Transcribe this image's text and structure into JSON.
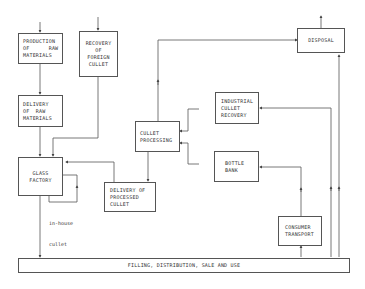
{
  "diagram": {
    "type": "flowchart",
    "nodes": {
      "production_raw": {
        "lines": [
          "PRODUCTION",
          "OF      RAW",
          "MATERIALS"
        ]
      },
      "recovery_foreign": {
        "lines": [
          "RECOVERY",
          "OF",
          "FOREIGN",
          "CULLET"
        ]
      },
      "delivery_raw": {
        "lines": [
          "DELIVERY",
          "OF  RAW",
          "MATERIALS"
        ]
      },
      "glass_factory": {
        "lines": [
          "GLASS",
          "",
          "FACTORY"
        ]
      },
      "delivery_processed": {
        "lines": [
          "DELIVERY OF",
          "PROCESSED",
          "CULLET"
        ]
      },
      "cullet_processing": {
        "lines": [
          "CULLET",
          "",
          "PROCESSING"
        ]
      },
      "industrial_recovery": {
        "lines": [
          "INDUSTRIAL",
          "CULLET",
          "RECOVERY"
        ]
      },
      "bottle_bank": {
        "lines": [
          "BOTTLE",
          "",
          "BANK"
        ]
      },
      "disposal": {
        "lines": [
          "DISPOSAL"
        ]
      },
      "consumer_transport": {
        "lines": [
          "CONSUMER",
          "TRANSPORT"
        ]
      },
      "filling": {
        "lines": [
          "FILLING, DISTRIBUTION, SALE AND USE"
        ]
      }
    },
    "annotations": {
      "in_house": {
        "lines": [
          "in-house",
          "cullet"
        ]
      }
    },
    "edges": [
      {
        "from": "external",
        "to": "production_raw"
      },
      {
        "from": "external",
        "to": "recovery_foreign"
      },
      {
        "from": "production_raw",
        "to": "delivery_raw"
      },
      {
        "from": "delivery_raw",
        "to": "glass_factory"
      },
      {
        "from": "recovery_foreign",
        "to": "glass_factory"
      },
      {
        "from": "glass_factory",
        "to": "glass_factory",
        "label": "in-house cullet"
      },
      {
        "from": "glass_factory",
        "to": "filling"
      },
      {
        "from": "delivery_processed",
        "to": "glass_factory"
      },
      {
        "from": "cullet_processing",
        "to": "delivery_processed"
      },
      {
        "from": "cullet_processing",
        "to": "disposal"
      },
      {
        "from": "industrial_recovery",
        "to": "cullet_processing"
      },
      {
        "from": "bottle_bank",
        "to": "cullet_processing"
      },
      {
        "from": "filling",
        "to": "industrial_recovery"
      },
      {
        "from": "consumer_transport",
        "to": "bottle_bank"
      },
      {
        "from": "filling",
        "to": "consumer_transport"
      },
      {
        "from": "filling",
        "to": "disposal"
      },
      {
        "from": "disposal",
        "to": "external"
      }
    ]
  }
}
